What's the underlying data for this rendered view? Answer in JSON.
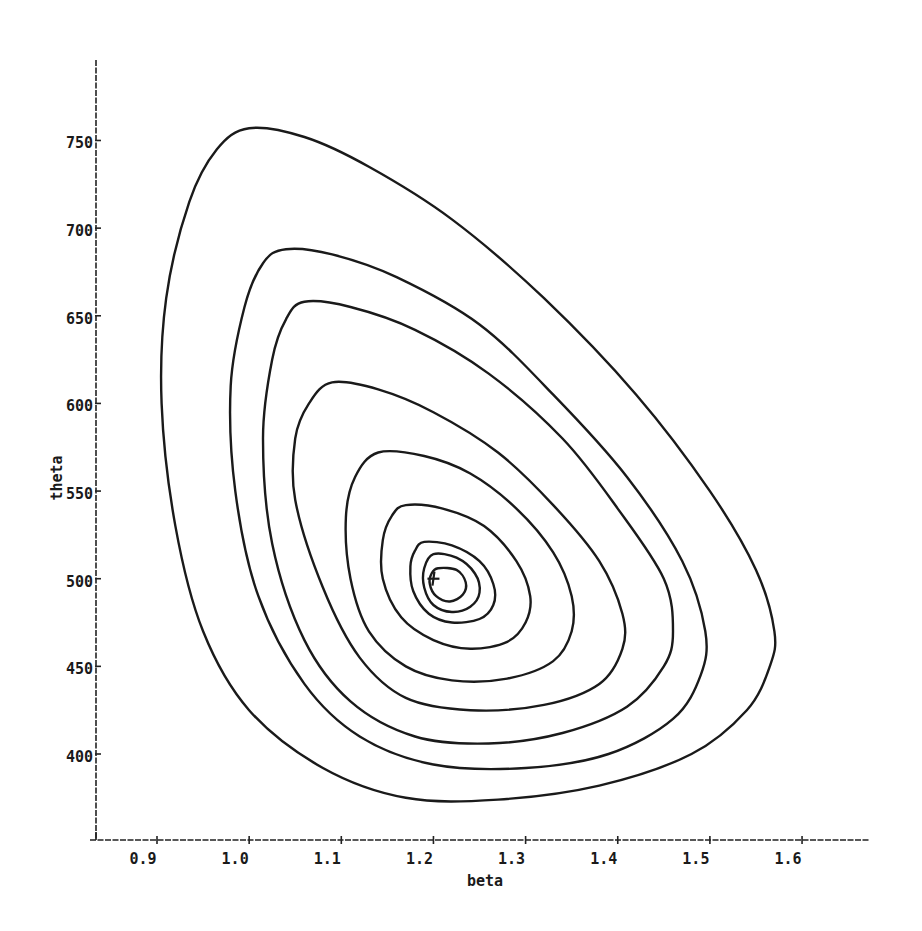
{
  "chart_data": {
    "type": "contour",
    "title": "",
    "xlabel": "beta",
    "ylabel": "theta",
    "xlim": [
      0.84,
      1.69
    ],
    "ylim": [
      352,
      795
    ],
    "grid": false,
    "legend": null,
    "x_ticks": [
      {
        "value": 0.9,
        "label": "0.9"
      },
      {
        "value": 1.0,
        "label": "1.0"
      },
      {
        "value": 1.1,
        "label": "1.1"
      },
      {
        "value": 1.2,
        "label": "1.2"
      },
      {
        "value": 1.3,
        "label": "1.3"
      },
      {
        "value": 1.4,
        "label": "1.4"
      },
      {
        "value": 1.5,
        "label": "1.5"
      },
      {
        "value": 1.6,
        "label": "1.6"
      }
    ],
    "y_ticks": [
      {
        "value": 400,
        "label": "400"
      },
      {
        "value": 450,
        "label": "450"
      },
      {
        "value": 500,
        "label": "500"
      },
      {
        "value": 550,
        "label": "550"
      },
      {
        "value": 600,
        "label": "600"
      },
      {
        "value": 650,
        "label": "650"
      },
      {
        "value": 700,
        "label": "700"
      },
      {
        "value": 750,
        "label": "750"
      }
    ],
    "maximum_marker": {
      "beta": 1.2,
      "theta": 500,
      "symbol": "+"
    },
    "contours": [
      {
        "level_index": 1,
        "points": [
          [
            1.0,
            757
          ],
          [
            1.06,
            752
          ],
          [
            1.13,
            735
          ],
          [
            1.22,
            705
          ],
          [
            1.32,
            660
          ],
          [
            1.42,
            605
          ],
          [
            1.5,
            550
          ],
          [
            1.55,
            505
          ],
          [
            1.57,
            470
          ],
          [
            1.565,
            450
          ],
          [
            1.54,
            425
          ],
          [
            1.48,
            400
          ],
          [
            1.38,
            382
          ],
          [
            1.27,
            374
          ],
          [
            1.17,
            375
          ],
          [
            1.08,
            392
          ],
          [
            1.0,
            425
          ],
          [
            0.95,
            470
          ],
          [
            0.92,
            530
          ],
          [
            0.905,
            600
          ],
          [
            0.91,
            660
          ],
          [
            0.935,
            715
          ],
          [
            0.965,
            745
          ]
        ]
      },
      {
        "level_index": 2,
        "points": [
          [
            1.04,
            688
          ],
          [
            1.09,
            685
          ],
          [
            1.16,
            672
          ],
          [
            1.25,
            645
          ],
          [
            1.33,
            605
          ],
          [
            1.41,
            558
          ],
          [
            1.47,
            510
          ],
          [
            1.495,
            470
          ],
          [
            1.49,
            445
          ],
          [
            1.46,
            420
          ],
          [
            1.39,
            400
          ],
          [
            1.3,
            392
          ],
          [
            1.2,
            394
          ],
          [
            1.12,
            410
          ],
          [
            1.06,
            440
          ],
          [
            1.01,
            490
          ],
          [
            0.985,
            550
          ],
          [
            0.98,
            610
          ],
          [
            0.995,
            655
          ],
          [
            1.015,
            680
          ]
        ]
      },
      {
        "level_index": 3,
        "points": [
          [
            1.06,
            658
          ],
          [
            1.11,
            655
          ],
          [
            1.18,
            642
          ],
          [
            1.26,
            617
          ],
          [
            1.34,
            580
          ],
          [
            1.4,
            540
          ],
          [
            1.45,
            500
          ],
          [
            1.46,
            470
          ],
          [
            1.45,
            450
          ],
          [
            1.41,
            427
          ],
          [
            1.34,
            412
          ],
          [
            1.26,
            406
          ],
          [
            1.18,
            410
          ],
          [
            1.11,
            430
          ],
          [
            1.06,
            465
          ],
          [
            1.025,
            520
          ],
          [
            1.015,
            580
          ],
          [
            1.025,
            625
          ],
          [
            1.04,
            648
          ]
        ]
      },
      {
        "level_index": 4,
        "points": [
          [
            1.09,
            612
          ],
          [
            1.14,
            608
          ],
          [
            1.2,
            595
          ],
          [
            1.27,
            572
          ],
          [
            1.33,
            542
          ],
          [
            1.38,
            510
          ],
          [
            1.405,
            480
          ],
          [
            1.405,
            460
          ],
          [
            1.38,
            440
          ],
          [
            1.32,
            428
          ],
          [
            1.24,
            425
          ],
          [
            1.17,
            432
          ],
          [
            1.12,
            455
          ],
          [
            1.08,
            495
          ],
          [
            1.05,
            545
          ],
          [
            1.05,
            580
          ],
          [
            1.065,
            600
          ]
        ]
      },
      {
        "level_index": 5,
        "points": [
          [
            1.14,
            572
          ],
          [
            1.19,
            570
          ],
          [
            1.24,
            560
          ],
          [
            1.29,
            540
          ],
          [
            1.33,
            515
          ],
          [
            1.35,
            490
          ],
          [
            1.35,
            470
          ],
          [
            1.33,
            453
          ],
          [
            1.28,
            443
          ],
          [
            1.22,
            442
          ],
          [
            1.17,
            450
          ],
          [
            1.13,
            470
          ],
          [
            1.11,
            500
          ],
          [
            1.105,
            535
          ],
          [
            1.115,
            558
          ]
        ]
      },
      {
        "level_index": 6,
        "points": [
          [
            1.17,
            542
          ],
          [
            1.21,
            540
          ],
          [
            1.255,
            530
          ],
          [
            1.29,
            510
          ],
          [
            1.305,
            490
          ],
          [
            1.3,
            475
          ],
          [
            1.28,
            464
          ],
          [
            1.24,
            460
          ],
          [
            1.2,
            465
          ],
          [
            1.165,
            478
          ],
          [
            1.145,
            500
          ],
          [
            1.145,
            522
          ],
          [
            1.155,
            536
          ]
        ]
      },
      {
        "level_index": 7,
        "points": [
          [
            1.19,
            521
          ],
          [
            1.22,
            519
          ],
          [
            1.25,
            510
          ],
          [
            1.265,
            497
          ],
          [
            1.265,
            485
          ],
          [
            1.25,
            477
          ],
          [
            1.22,
            475
          ],
          [
            1.195,
            480
          ],
          [
            1.178,
            493
          ],
          [
            1.175,
            507
          ],
          [
            1.18,
            516
          ]
        ]
      },
      {
        "level_index": 8,
        "points": [
          [
            1.2,
            514
          ],
          [
            1.225,
            512
          ],
          [
            1.245,
            503
          ],
          [
            1.25,
            492
          ],
          [
            1.24,
            484
          ],
          [
            1.22,
            481
          ],
          [
            1.2,
            485
          ],
          [
            1.19,
            495
          ],
          [
            1.19,
            506
          ]
        ]
      },
      {
        "level_index": 9,
        "points": [
          [
            1.205,
            506
          ],
          [
            1.225,
            505
          ],
          [
            1.235,
            498
          ],
          [
            1.232,
            491
          ],
          [
            1.218,
            487
          ],
          [
            1.203,
            490
          ],
          [
            1.196,
            497
          ],
          [
            1.198,
            503
          ]
        ]
      }
    ]
  },
  "layout": {
    "plot_left_px": 96,
    "plot_right_px": 870,
    "axis_y_top_px": 60,
    "axis_x_px": 840,
    "x_px_per_unit": 921.5,
    "x_origin_value": 0.9,
    "x_origin_px": 157,
    "y_px_per_unit": 1.7529,
    "y_origin_value": 400,
    "y_origin_px": 754
  }
}
